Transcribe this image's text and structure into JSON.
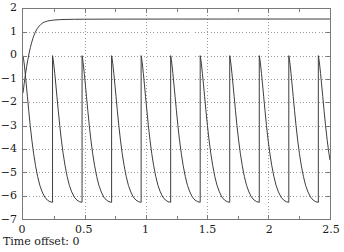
{
  "window": {
    "title": "Scope",
    "status_label": "Time offset: 0"
  },
  "colors": {
    "background": "#ffffff",
    "axis": "#7a7a7a",
    "grid": "#9a9a9a",
    "trace": "#3c3c3c",
    "text": "#1a1a1a"
  },
  "chart_data": {
    "type": "line",
    "title": "",
    "xlabel": "",
    "ylabel": "",
    "xlim": [
      0,
      2.5
    ],
    "ylim": [
      -7,
      2
    ],
    "grid": true,
    "grid_style": "dotted",
    "legend": null,
    "xticks": [
      "0",
      "0.5",
      "1",
      "1.5",
      "2",
      "2.5"
    ],
    "xtick_values": [
      0,
      0.5,
      1,
      1.5,
      2,
      2.5
    ],
    "xminor_ticks": [
      0.25,
      0.75,
      1.25,
      1.75,
      2.25
    ],
    "yticks": [
      "2",
      "1",
      "0",
      "−1",
      "−2",
      "−3",
      "−4",
      "−5",
      "−6",
      "−7"
    ],
    "ytick_values": [
      2,
      1,
      0,
      -1,
      -2,
      -3,
      -4,
      -5,
      -6,
      -7
    ],
    "series": [
      {
        "name": "settling-curve",
        "description": "Monotonic rise from -1.6 at t=0 asymptotic to 1.57",
        "points": [
          [
            0.0,
            -1.6
          ],
          [
            0.01,
            -1.18
          ],
          [
            0.02,
            -0.8
          ],
          [
            0.03,
            -0.46
          ],
          [
            0.04,
            -0.16
          ],
          [
            0.05,
            0.11
          ],
          [
            0.06,
            0.35
          ],
          [
            0.07,
            0.555
          ],
          [
            0.08,
            0.73
          ],
          [
            0.09,
            0.88
          ],
          [
            0.1,
            1.005
          ],
          [
            0.115,
            1.15
          ],
          [
            0.13,
            1.26
          ],
          [
            0.145,
            1.34
          ],
          [
            0.16,
            1.4
          ],
          [
            0.18,
            1.452
          ],
          [
            0.2,
            1.485
          ],
          [
            0.23,
            1.513
          ],
          [
            0.26,
            1.53
          ],
          [
            0.3,
            1.544
          ],
          [
            0.35,
            1.553
          ],
          [
            0.42,
            1.559
          ],
          [
            0.5,
            1.562
          ],
          [
            0.62,
            1.565
          ],
          [
            0.8,
            1.567
          ],
          [
            1.0,
            1.568
          ],
          [
            1.3,
            1.569
          ],
          [
            1.7,
            1.57
          ],
          [
            2.1,
            1.57
          ],
          [
            2.5,
            1.57
          ]
        ]
      },
      {
        "name": "phase-sawtooth",
        "description": "Decaying arc from 0 down to -6.283 repeated; first cycle starts at 0 from value 0",
        "period": 0.2405,
        "peak": 0.0,
        "trough": -6.283,
        "first_drop_time": 0.2405,
        "cycles": [
          {
            "start": 0.0,
            "end": 0.2405
          },
          {
            "start": 0.2405,
            "end": 0.481
          },
          {
            "start": 0.481,
            "end": 0.7215
          },
          {
            "start": 0.7215,
            "end": 0.962
          },
          {
            "start": 0.962,
            "end": 1.2025
          },
          {
            "start": 1.2025,
            "end": 1.443
          },
          {
            "start": 1.443,
            "end": 1.6835
          },
          {
            "start": 1.6835,
            "end": 1.924
          },
          {
            "start": 1.924,
            "end": 2.1645
          },
          {
            "start": 2.1645,
            "end": 2.405
          },
          {
            "start": 2.405,
            "end": 2.5
          }
        ],
        "shape_points_normalized": [
          [
            0.0,
            0.0
          ],
          [
            0.02,
            -0.15
          ],
          [
            0.045,
            -0.4
          ],
          [
            0.075,
            -0.76
          ],
          [
            0.11,
            -1.22
          ],
          [
            0.15,
            -1.76
          ],
          [
            0.195,
            -2.36
          ],
          [
            0.245,
            -3.0
          ],
          [
            0.3,
            -3.62
          ],
          [
            0.36,
            -4.2
          ],
          [
            0.425,
            -4.72
          ],
          [
            0.495,
            -5.18
          ],
          [
            0.57,
            -5.56
          ],
          [
            0.65,
            -5.84
          ],
          [
            0.735,
            -6.06
          ],
          [
            0.825,
            -6.19
          ],
          [
            0.915,
            -6.26
          ],
          [
            1.0,
            -6.283
          ]
        ]
      }
    ]
  }
}
